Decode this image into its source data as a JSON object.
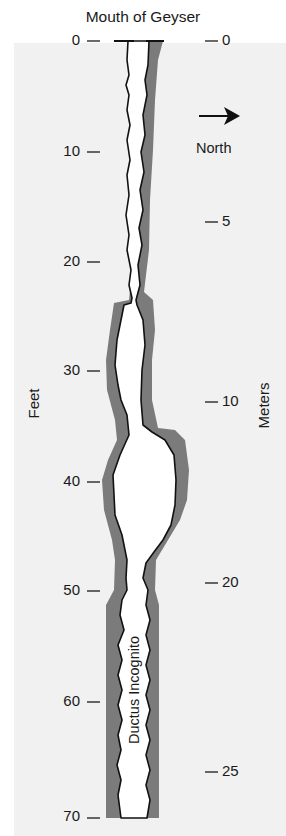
{
  "title": "Mouth of Geyser",
  "feet_axis": {
    "label": "Feet",
    "ticks": [
      {
        "label": "0",
        "y": 40
      },
      {
        "label": "10",
        "y": 151
      },
      {
        "label": "20",
        "y": 261
      },
      {
        "label": "30",
        "y": 370
      },
      {
        "label": "40",
        "y": 481
      },
      {
        "label": "50",
        "y": 590
      },
      {
        "label": "60",
        "y": 701
      },
      {
        "label": "70",
        "y": 816
      }
    ]
  },
  "meters_axis": {
    "label": "Meters",
    "ticks": [
      {
        "label": "0",
        "y": 40
      },
      {
        "label": "5",
        "y": 221
      },
      {
        "label": "10",
        "y": 401
      },
      {
        "label": "20",
        "y": 582
      },
      {
        "label": "25",
        "y": 771
      }
    ]
  },
  "compass": {
    "label": "North",
    "direction": "right"
  },
  "conduit_label": "Ductus Incognito",
  "colors": {
    "wall": "#7b7b7b",
    "outline": "#111111",
    "channel": "#ffffff",
    "background": "#f1f1f1"
  }
}
